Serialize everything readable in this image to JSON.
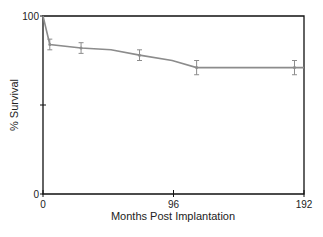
{
  "chart_data": {
    "type": "line",
    "title": "",
    "xlabel": "Months Post Implantation",
    "ylabel": "% Survival",
    "xlim": [
      0,
      192
    ],
    "ylim": [
      0,
      100
    ],
    "x_ticks": [
      "0",
      "96",
      "192"
    ],
    "y_ticks": [
      "0",
      "100"
    ],
    "grid": false,
    "series": [
      {
        "name": "Survival",
        "color": "#8c8c8c",
        "points": [
          {
            "x": 0,
            "y": 100
          },
          {
            "x": 5,
            "y": 84,
            "err": 3
          },
          {
            "x": 28,
            "y": 82,
            "err": 3
          },
          {
            "x": 50,
            "y": 81
          },
          {
            "x": 71,
            "y": 78,
            "err": 3
          },
          {
            "x": 95,
            "y": 75
          },
          {
            "x": 113,
            "y": 71,
            "err": 4
          },
          {
            "x": 185,
            "y": 71,
            "err": 4
          },
          {
            "x": 192,
            "y": 71
          }
        ]
      }
    ]
  }
}
